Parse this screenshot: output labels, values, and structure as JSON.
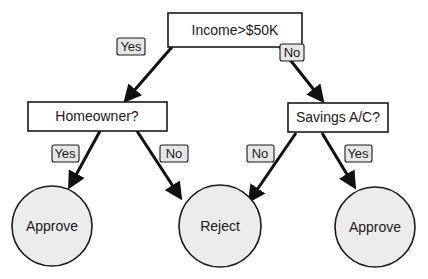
{
  "diagram": {
    "type": "decision-tree",
    "colors": {
      "stroke": "#1a1a1a",
      "leaf_fill": "#ececec",
      "badge_fill": "#e6e6e6",
      "box_fill": "#ffffff"
    },
    "nodes": {
      "root": {
        "label": "Income>$50K"
      },
      "homeowner": {
        "label": "Homeowner?"
      },
      "savings": {
        "label": "Savings A/C?"
      },
      "leaf_approve_left": {
        "label": "Approve"
      },
      "leaf_reject": {
        "label": "Reject"
      },
      "leaf_approve_right": {
        "label": "Approve"
      }
    },
    "edges": {
      "root_to_homeowner": {
        "label": "Yes"
      },
      "root_to_savings": {
        "label": "No"
      },
      "homeowner_to_approve": {
        "label": "Yes"
      },
      "homeowner_to_reject": {
        "label": "No"
      },
      "savings_to_reject": {
        "label": "No"
      },
      "savings_to_approve": {
        "label": "Yes"
      }
    }
  }
}
